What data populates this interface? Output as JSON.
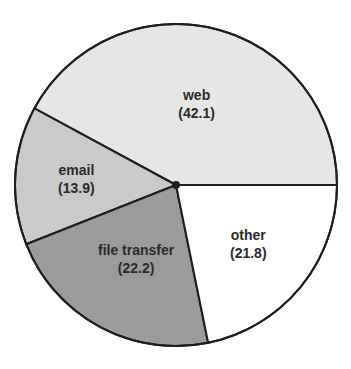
{
  "chart_data": {
    "type": "pie",
    "title": "",
    "start_angle_deg": 0,
    "direction": "counterclockwise",
    "slices": [
      {
        "label": "web",
        "value": 42.1,
        "value_label": "(42.1)",
        "color": "#e6e6e6"
      },
      {
        "label": "email",
        "value": 13.9,
        "value_label": "(13.9)",
        "color": "#cacaca"
      },
      {
        "label": "file transfer",
        "value": 22.2,
        "value_label": "(22.2)",
        "color": "#9b9b9b"
      },
      {
        "label": "other",
        "value": 21.8,
        "value_label": "(21.8)",
        "color": "#ffffff"
      }
    ],
    "legend": "none"
  }
}
